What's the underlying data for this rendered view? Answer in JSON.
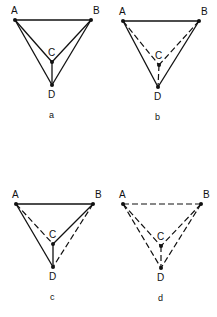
{
  "panels": [
    {
      "caption": "a",
      "points": {
        "A": [
          15,
          20
        ],
        "B": [
          91,
          20
        ],
        "C": [
          52,
          62
        ],
        "D": [
          52,
          85
        ]
      },
      "labels": {
        "A": "A",
        "B": "B",
        "C": "C",
        "D": "D"
      },
      "edges": [
        {
          "from": "A",
          "to": "B",
          "style": "solid"
        },
        {
          "from": "A",
          "to": "C",
          "style": "solid"
        },
        {
          "from": "A",
          "to": "D",
          "style": "solid"
        },
        {
          "from": "B",
          "to": "C",
          "style": "solid"
        },
        {
          "from": "B",
          "to": "D",
          "style": "solid"
        },
        {
          "from": "C",
          "to": "D",
          "style": "solid"
        }
      ]
    },
    {
      "caption": "b",
      "points": {
        "A": [
          123,
          21
        ],
        "B": [
          199,
          21
        ],
        "C": [
          159,
          65
        ],
        "D": [
          158,
          87
        ]
      },
      "labels": {
        "A": "A",
        "B": "B",
        "C": "C",
        "D": "D"
      },
      "edges": [
        {
          "from": "A",
          "to": "B",
          "style": "solid"
        },
        {
          "from": "A",
          "to": "C",
          "style": "dashed"
        },
        {
          "from": "A",
          "to": "D",
          "style": "solid"
        },
        {
          "from": "B",
          "to": "C",
          "style": "dashed"
        },
        {
          "from": "B",
          "to": "D",
          "style": "solid"
        },
        {
          "from": "C",
          "to": "D",
          "style": "dashed"
        }
      ]
    },
    {
      "caption": "c",
      "points": {
        "A": [
          16,
          204
        ],
        "B": [
          93,
          204
        ],
        "C": [
          53,
          244
        ],
        "D": [
          53,
          267
        ]
      },
      "labels": {
        "A": "A",
        "B": "B",
        "C": "C",
        "D": "D"
      },
      "edges": [
        {
          "from": "A",
          "to": "B",
          "style": "solid"
        },
        {
          "from": "A",
          "to": "C",
          "style": "dashed"
        },
        {
          "from": "A",
          "to": "D",
          "style": "solid"
        },
        {
          "from": "B",
          "to": "C",
          "style": "solid"
        },
        {
          "from": "B",
          "to": "D",
          "style": "dashed"
        },
        {
          "from": "C",
          "to": "D",
          "style": "solid"
        }
      ]
    },
    {
      "caption": "d",
      "points": {
        "A": [
          123,
          204
        ],
        "B": [
          201,
          204
        ],
        "C": [
          161,
          246
        ],
        "D": [
          161,
          268
        ]
      },
      "labels": {
        "A": "A",
        "B": "B",
        "C": "C",
        "D": "D"
      },
      "edges": [
        {
          "from": "A",
          "to": "B",
          "style": "dashed"
        },
        {
          "from": "A",
          "to": "C",
          "style": "dashed"
        },
        {
          "from": "A",
          "to": "D",
          "style": "dashed"
        },
        {
          "from": "B",
          "to": "C",
          "style": "dashed"
        },
        {
          "from": "B",
          "to": "D",
          "style": "dashed"
        },
        {
          "from": "C",
          "to": "D",
          "style": "dashed"
        }
      ]
    }
  ],
  "colors": {
    "ink": "#111111",
    "background": "#ffffff"
  }
}
